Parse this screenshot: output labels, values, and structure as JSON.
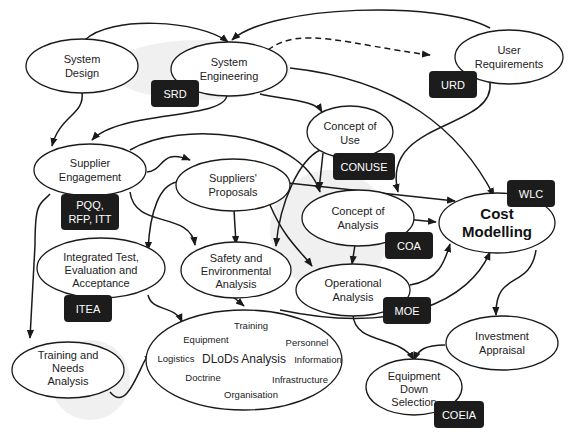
{
  "diagram": {
    "nodes": {
      "system_design": {
        "line1": "System",
        "line2": "Design"
      },
      "system_engineering": {
        "line1": "System",
        "line2": "Engineering"
      },
      "user_requirements": {
        "line1": "User",
        "line2": "Requirements"
      },
      "concept_of_use": {
        "line1": "Concept of",
        "line2": "Use"
      },
      "supplier_engagement": {
        "line1": "Supplier",
        "line2": "Engagement"
      },
      "suppliers_proposals": {
        "line1": "Suppliers'",
        "line2": "Proposals"
      },
      "concept_of_analysis": {
        "line1": "Concept of",
        "line2": "Analysis"
      },
      "cost_modelling": {
        "line1": "Cost",
        "line2": "Modelling"
      },
      "integrated_test": {
        "line1": "Integrated Test,",
        "line2": "Evaluation and",
        "line3": "Acceptance"
      },
      "safety_env": {
        "line1": "Safety and",
        "line2": "Environmental",
        "line3": "Analysis"
      },
      "operational_analysis": {
        "line1": "Operational",
        "line2": "Analysis"
      },
      "investment_appraisal": {
        "line1": "Investment",
        "line2": "Appraisal"
      },
      "training_needs": {
        "line1": "Training and",
        "line2": "Needs",
        "line3": "Analysis"
      },
      "equipment_down_selection": {
        "line1": "Equipment",
        "line2": "Down",
        "line3": "Selection"
      },
      "dlods": {
        "center": "DLoDs Analysis",
        "items": {
          "training": "Training",
          "equipment": "Equipment",
          "personnel": "Personnel",
          "logistics": "Logistics",
          "information": "Information",
          "doctrine": "Doctrine",
          "infrastructure": "Infrastructure",
          "organisation": "Organisation"
        }
      }
    },
    "tags": {
      "srd": "SRD",
      "urd": "URD",
      "conuse": "CONUSE",
      "pqq_line1": "PQQ,",
      "pqq_line2": "RFP, ITT",
      "wlc": "WLC",
      "coa": "COA",
      "itea": "ITEA",
      "moe": "MOE",
      "coeia": "COEIA"
    },
    "colors": {
      "stroke": "#1a1a1a",
      "tag_fill": "#1c1c1c",
      "tag_text": "#ffffff",
      "node_fill": "#ffffff"
    }
  }
}
